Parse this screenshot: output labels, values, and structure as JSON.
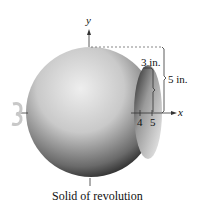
{
  "figure": {
    "axis_x_label": "x",
    "axis_y_label": "y",
    "tick_4": "4",
    "tick_5": "5",
    "dim_inner": "3 in.",
    "dim_outer": "5 in.",
    "caption": "Solid of revolution",
    "colors": {
      "sphere_light": "#e8e8e8",
      "sphere_dark": "#1a1a1a",
      "rotation_arrow": "#c8c8c8"
    }
  }
}
